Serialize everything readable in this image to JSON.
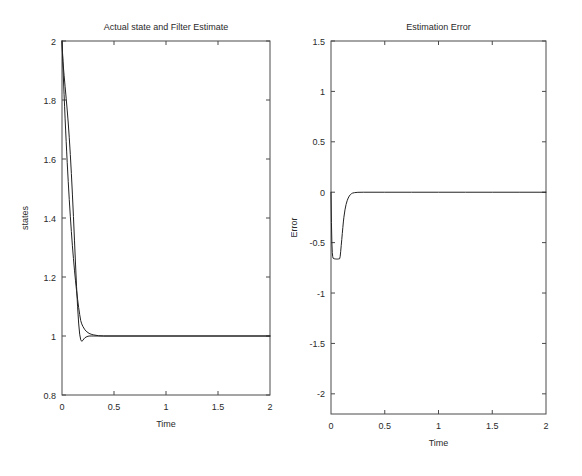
{
  "figure": {
    "width": 582,
    "height": 476,
    "background": "#ffffff",
    "line_color": "#222222",
    "axis_color": "#4a4a4a",
    "text_color": "#2a2a2a"
  },
  "chart_data": [
    {
      "type": "line",
      "panel": "left",
      "title": "Actual state and Filter Estimate",
      "xlabel": "Time",
      "ylabel": "states",
      "xlim": [
        0,
        2
      ],
      "ylim": [
        0.8,
        2
      ],
      "xticks": [
        0,
        0.5,
        1,
        1.5,
        2
      ],
      "xticklabels": [
        "0",
        "0.5",
        "1",
        "1.5",
        "2"
      ],
      "yticks": [
        0.8,
        1,
        1.2,
        1.4,
        1.6,
        1.8,
        2
      ],
      "yticklabels": [
        "0.8",
        "1",
        "1.2",
        "1.4",
        "1.6",
        "1.8",
        "2"
      ],
      "grid": false,
      "legend": null,
      "series": [
        {
          "name": "Actual state",
          "x": [
            0,
            0.005,
            0.01,
            0.015,
            0.02,
            0.025,
            0.03,
            0.035,
            0.04,
            0.045,
            0.05,
            0.06,
            0.07,
            0.08,
            0.09,
            0.1,
            0.11,
            0.12,
            0.13,
            0.14,
            0.15,
            0.16,
            0.17,
            0.18,
            0.19,
            0.2,
            0.22,
            0.24,
            0.26,
            0.28,
            0.3,
            0.35,
            0.4,
            0.5,
            0.75,
            1.0,
            1.25,
            1.5,
            1.75,
            2.0
          ],
          "y": [
            2.0,
            1.952,
            1.906,
            1.861,
            1.818,
            1.777,
            1.736,
            1.698,
            1.66,
            1.624,
            1.589,
            1.523,
            1.462,
            1.406,
            1.354,
            1.306,
            1.263,
            1.223,
            1.187,
            1.154,
            1.124,
            1.097,
            1.073,
            1.052,
            1.041,
            1.033,
            1.021,
            1.014,
            1.009,
            1.006,
            1.004,
            1.001,
            1.0,
            1.0,
            1.0,
            1.0,
            1.0,
            1.0,
            1.0,
            1.0
          ]
        },
        {
          "name": "Filter estimate",
          "x": [
            0,
            0.005,
            0.01,
            0.015,
            0.02,
            0.03,
            0.04,
            0.05,
            0.06,
            0.07,
            0.08,
            0.09,
            0.1,
            0.11,
            0.12,
            0.13,
            0.14,
            0.15,
            0.16,
            0.17,
            0.18,
            0.19,
            0.2,
            0.21,
            0.22,
            0.24,
            0.26,
            0.28,
            0.3,
            0.35,
            0.4,
            0.5,
            0.75,
            1.0,
            1.25,
            1.5,
            1.75,
            2.0
          ],
          "y": [
            2.0,
            1.96,
            1.93,
            1.905,
            1.884,
            1.845,
            1.806,
            1.766,
            1.722,
            1.672,
            1.615,
            1.551,
            1.481,
            1.405,
            1.325,
            1.244,
            1.167,
            1.099,
            1.044,
            1.006,
            0.987,
            0.982,
            0.985,
            0.99,
            0.994,
            0.998,
            1.0,
            1.0,
            1.0,
            1.0,
            1.0,
            1.0,
            1.0,
            1.0,
            1.0,
            1.0,
            1.0,
            1.0
          ]
        }
      ]
    },
    {
      "type": "line",
      "panel": "right",
      "title": "Estimation Error",
      "xlabel": "Time",
      "ylabel": "Error",
      "xlim": [
        0,
        2
      ],
      "ylim": [
        -2.2,
        1.5
      ],
      "xticks": [
        0,
        0.5,
        1,
        1.5,
        2
      ],
      "xticklabels": [
        "0",
        "0.5",
        "1",
        "1.5",
        "2"
      ],
      "yticks": [
        -2,
        -1.5,
        -1,
        -0.5,
        0,
        0.5,
        1,
        1.5
      ],
      "yticklabels": [
        "-2",
        "-1.5",
        "-1",
        "-0.5",
        "0",
        "0.5",
        "1",
        "1.5"
      ],
      "grid": false,
      "legend": null,
      "series": [
        {
          "name": "Estimation error",
          "x": [
            0,
            0.004,
            0.008,
            0.012,
            0.016,
            0.02,
            0.03,
            0.04,
            0.05,
            0.06,
            0.07,
            0.08,
            0.085,
            0.09,
            0.095,
            0.1,
            0.105,
            0.11,
            0.115,
            0.12,
            0.13,
            0.14,
            0.15,
            0.16,
            0.17,
            0.18,
            0.19,
            0.2,
            0.22,
            0.25,
            0.3,
            0.4,
            0.5,
            0.75,
            1.0,
            1.25,
            1.5,
            1.75,
            2.0
          ],
          "y": [
            0.0,
            -0.3,
            -0.5,
            -0.6,
            -0.64,
            -0.655,
            -0.66,
            -0.662,
            -0.663,
            -0.663,
            -0.662,
            -0.66,
            -0.64,
            -0.59,
            -0.53,
            -0.47,
            -0.41,
            -0.35,
            -0.295,
            -0.248,
            -0.175,
            -0.122,
            -0.085,
            -0.058,
            -0.038,
            -0.024,
            -0.015,
            -0.009,
            -0.004,
            -0.001,
            0.0,
            0.0,
            0.0,
            0.0,
            0.0,
            0.0,
            0.0,
            0.0,
            0.0
          ]
        }
      ]
    }
  ]
}
